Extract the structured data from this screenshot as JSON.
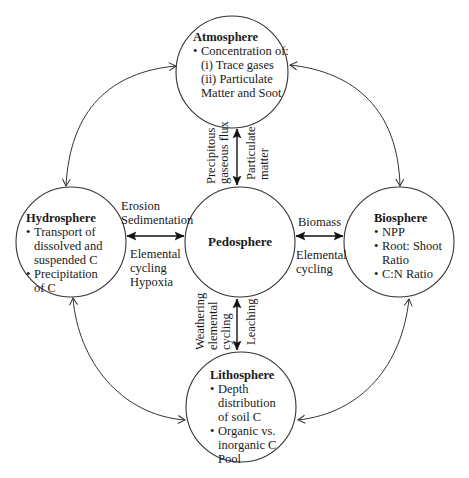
{
  "diagram": {
    "colors": {
      "stroke": "#333333",
      "text": "#1a1a1a",
      "background": "#ffffff"
    },
    "nodes": {
      "atmosphere": {
        "title": "Atmosphere",
        "items": [
          "Concentration of:",
          "(i) Trace gases",
          "(ii) Particulate Matter and Soot"
        ]
      },
      "hydrosphere": {
        "title": "Hydrosphere",
        "items": [
          "Transport of dissolved and suspended C",
          "Precipitation of C"
        ]
      },
      "pedosphere": {
        "title": "Pedosphere"
      },
      "biosphere": {
        "title": "Biosphere",
        "items": [
          "NPP",
          "Root: Shoot Ratio",
          "C:N Ratio"
        ]
      },
      "lithosphere": {
        "title": "Lithosphere",
        "items": [
          "Depth distribution of soil C",
          "Organic vs. inorganic C Pool"
        ]
      }
    },
    "links": {
      "atmosphere_pedosphere": {
        "left": [
          "Precipitous",
          "gaseous flux"
        ],
        "right": [
          "Particulate",
          "matter"
        ]
      },
      "hydrosphere_pedosphere": {
        "above": [
          "Erosion",
          "Sedimentation"
        ],
        "below": [
          "Elemental",
          "cycling",
          "Hypoxia"
        ]
      },
      "pedosphere_biosphere": {
        "above": [
          "Biomass"
        ],
        "below": [
          "Elemental",
          "cycling"
        ]
      },
      "pedosphere_lithosphere": {
        "left": [
          "Weathering",
          "elemental",
          "cycling"
        ],
        "right": [
          "Leaching"
        ]
      }
    },
    "outer_links": [
      {
        "from": "atmosphere",
        "to": "hydrosphere",
        "bidirectional": true
      },
      {
        "from": "atmosphere",
        "to": "biosphere",
        "bidirectional": true
      },
      {
        "from": "hydrosphere",
        "to": "lithosphere",
        "bidirectional": true
      },
      {
        "from": "biosphere",
        "to": "lithosphere",
        "bidirectional": true
      }
    ]
  }
}
